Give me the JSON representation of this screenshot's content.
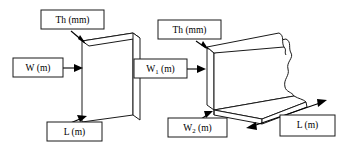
{
  "figure": {
    "background_color": "#ffffff",
    "line_color": "#1a1a1a",
    "text_color": "#000000"
  },
  "left_diagram": {
    "name": "flat-plate",
    "description": "Thin rectangular plate shown in isometric view",
    "labels": {
      "thickness": {
        "text": "Th (mm)",
        "symbol": "Th",
        "unit": "mm"
      },
      "width": {
        "text": "W (m)",
        "symbol": "W",
        "unit": "m"
      },
      "length": {
        "text": "L (m)",
        "symbol": "L",
        "unit": "m"
      }
    }
  },
  "right_diagram": {
    "name": "folded-sheet",
    "description": "L-shaped folded sheet with torn break edge shown in isometric view",
    "labels": {
      "thickness": {
        "text": "Th (mm)",
        "symbol": "Th",
        "unit": "mm"
      },
      "width1": {
        "text": "W",
        "sub": "1",
        "suffix": " (m)",
        "symbol": "W1",
        "unit": "m"
      },
      "width2": {
        "text": "W",
        "sub": "2",
        "suffix": " (m)",
        "symbol": "W2",
        "unit": "m"
      },
      "length": {
        "text": "L (m)",
        "symbol": "L",
        "unit": "m"
      }
    }
  }
}
